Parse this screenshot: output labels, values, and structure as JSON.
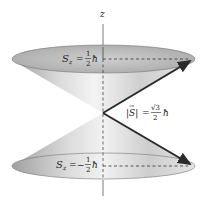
{
  "diagram": {
    "axis": {
      "label": "z"
    },
    "upper_cone": {
      "label_lhs": "S",
      "label_sub": "z",
      "label_eq": "=",
      "label_sign": "",
      "frac_num": "1",
      "frac_den": "2",
      "hbar": "ħ"
    },
    "lower_cone": {
      "label_lhs": "S",
      "label_sub": "z",
      "label_eq": "=",
      "label_sign": "−",
      "frac_num": "1",
      "frac_den": "2",
      "hbar": "ħ"
    },
    "magnitude": {
      "label_lhs": "|S|",
      "vector_arrow": "→",
      "label_eq": "=",
      "frac_num": "√3",
      "frac_den": "2",
      "hbar": "ħ"
    },
    "colors": {
      "cone_light": "#f2f2f2",
      "cone_mid": "#c8c8c8",
      "cone_dark": "#9a9a9a",
      "rim_fill": "#bdbdbd",
      "line": "#333333",
      "arrow": "#2a2a2a"
    }
  }
}
